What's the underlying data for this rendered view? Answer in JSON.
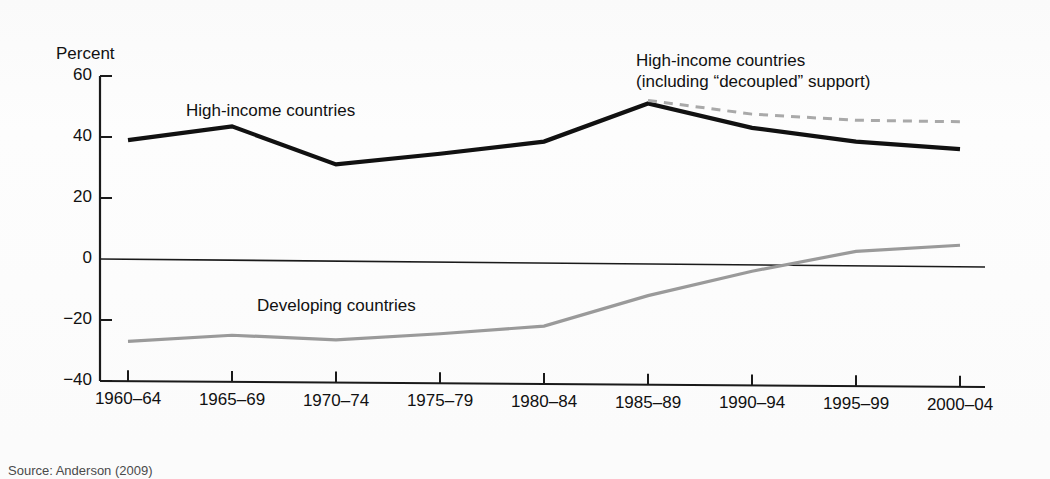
{
  "figure": {
    "source_note": "Source: Anderson (2009)",
    "running_head": "",
    "background": "#fbfbfb"
  },
  "axis": {
    "y_title": "Percent",
    "y_ticks": [
      "60",
      "40",
      "20",
      "0",
      "−20",
      "−40"
    ],
    "x_ticks": [
      "1960–64",
      "1965–69",
      "1970–74",
      "1975–79",
      "1980–84",
      "1985–89",
      "1990–94",
      "1995–99",
      "2000–04"
    ]
  },
  "labels": {
    "high_income": "High-income countries",
    "decoupled_line1": "High-income countries",
    "decoupled_line2": "(including “decoupled” support)",
    "developing": "Developing countries"
  },
  "colors": {
    "high_income": "#111111",
    "decoupled": "#a9a9a9",
    "developing": "#9a9a9a",
    "axis": "#1a1a1a",
    "zero_line": "#1a1a1a"
  },
  "chart_data": {
    "type": "line",
    "title": "",
    "xlabel": "",
    "ylabel": "Percent",
    "ylim": [
      -40,
      60
    ],
    "grid": false,
    "legend": "inline-annotations",
    "categories": [
      "1960–64",
      "1965–69",
      "1970–74",
      "1975–79",
      "1980–84",
      "1985–89",
      "1990–94",
      "1995–99",
      "2000–04"
    ],
    "series": [
      {
        "name": "High-income countries",
        "color": "#111111",
        "style": "solid",
        "values": [
          39,
          43.5,
          31,
          34.5,
          38.5,
          51,
          43,
          38.5,
          36
        ]
      },
      {
        "name": "High-income countries (including “decoupled” support)",
        "color": "#a9a9a9",
        "style": "dashed",
        "values": [
          null,
          null,
          null,
          null,
          null,
          52,
          47.5,
          45.5,
          45
        ]
      },
      {
        "name": "Developing countries",
        "color": "#9a9a9a",
        "style": "solid",
        "values": [
          -27,
          -25,
          -26.5,
          -24.5,
          -22,
          -12,
          -4,
          2.5,
          4.5
        ]
      }
    ]
  },
  "geometry": {
    "plot_left": 100,
    "plot_right": 985,
    "y_top_value": 60,
    "y_top_px": 76,
    "y_bottom_value": -40,
    "y_bottom_px": 381,
    "x_first_px": 128,
    "x_step_px": 104
  }
}
